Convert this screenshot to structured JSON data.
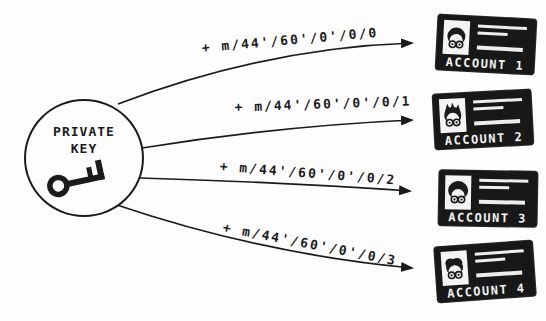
{
  "diagram": {
    "type": "hd-wallet-key-derivation",
    "source_node": {
      "line1": "PRIVATE",
      "line2": "KEY",
      "icon": "key-icon"
    },
    "derivation_paths": [
      {
        "label": "+ m/44'/60'/0'/0/0"
      },
      {
        "label": "+ m/44'/60'/0'/0/1"
      },
      {
        "label": "+ m/44'/60'/0'/0/2"
      },
      {
        "label": "+ m/44'/60'/0'/0/3"
      }
    ],
    "accounts": [
      {
        "label": "ACCOUNT 1",
        "icon": "person-with-glasses-icon"
      },
      {
        "label": "ACCOUNT 2",
        "icon": "person-with-glasses-icon"
      },
      {
        "label": "ACCOUNT 3",
        "icon": "person-with-glasses-icon"
      },
      {
        "label": "ACCOUNT 4",
        "icon": "person-with-glasses-icon"
      }
    ],
    "colors": {
      "ink": "#1b1b1b",
      "background": "#fdfdfd",
      "card_background": "#181818",
      "card_text": "#f2f2f2",
      "photo_background": "#f4f4f4"
    }
  }
}
